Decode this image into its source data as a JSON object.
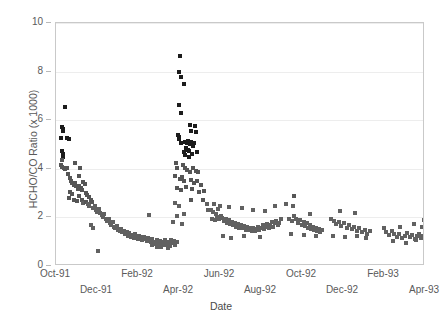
{
  "chart_data": {
    "type": "scatter",
    "title": "",
    "xlabel": "Date",
    "ylabel": "HCHO/CO Ratio (x 1000)",
    "ylim": [
      0,
      10
    ],
    "yticks": [
      0,
      2,
      4,
      6,
      8,
      10
    ],
    "ytick_labels": [
      "0",
      "2",
      "4",
      "6",
      "8",
      "10"
    ],
    "grid": "horizontal",
    "legend": "none",
    "marker": "square",
    "marker_color": "#616161",
    "frame_color": "#c9c9c9",
    "xlim_months": [
      0,
      18
    ],
    "xtick_months": [
      0,
      2,
      4,
      6,
      8,
      10,
      12,
      14,
      16,
      18
    ],
    "xtick_labels": [
      "Oct-91",
      "Dec-91",
      "Feb-92",
      "Apr-92",
      "Jun-92",
      "Aug-92",
      "Oct-92",
      "Dec-92",
      "Feb-93",
      "Apr-93"
    ],
    "xtick_rows": [
      0,
      1,
      0,
      1,
      0,
      1,
      0,
      1,
      0,
      1
    ],
    "x_unit": "months since Oct-91",
    "series": [
      {
        "name": "HCHO/CO ratio",
        "points": [
          [
            0.42,
            6.55
          ],
          [
            0.3,
            5.7
          ],
          [
            0.33,
            5.62
          ],
          [
            0.36,
            5.55
          ],
          [
            0.22,
            5.28
          ],
          [
            0.55,
            5.25
          ],
          [
            0.62,
            5.22
          ],
          [
            0.3,
            4.72
          ],
          [
            0.33,
            4.6
          ],
          [
            0.36,
            4.5
          ],
          [
            0.28,
            4.38
          ],
          [
            0.24,
            4.15
          ],
          [
            0.31,
            4.08
          ],
          [
            0.38,
            4.02
          ],
          [
            0.45,
            3.98
          ],
          [
            0.52,
            4.05
          ],
          [
            0.95,
            4.25
          ],
          [
            1.18,
            4.05
          ],
          [
            1.1,
            3.72
          ],
          [
            0.58,
            3.8
          ],
          [
            0.66,
            3.62
          ],
          [
            0.72,
            3.5
          ],
          [
            0.8,
            3.4
          ],
          [
            0.86,
            3.35
          ],
          [
            0.92,
            3.42
          ],
          [
            0.99,
            3.28
          ],
          [
            1.05,
            3.18
          ],
          [
            1.12,
            3.3
          ],
          [
            1.2,
            3.2
          ],
          [
            1.27,
            3.12
          ],
          [
            1.34,
            3.45
          ],
          [
            1.4,
            3.38
          ],
          [
            1.47,
            3.0
          ],
          [
            1.52,
            2.92
          ],
          [
            1.6,
            2.85
          ],
          [
            0.7,
            3.05
          ],
          [
            0.78,
            2.95
          ],
          [
            0.62,
            2.78
          ],
          [
            0.88,
            2.7
          ],
          [
            1.0,
            2.68
          ],
          [
            1.1,
            2.88
          ],
          [
            1.25,
            2.72
          ],
          [
            1.32,
            2.58
          ],
          [
            1.44,
            2.62
          ],
          [
            1.55,
            2.55
          ],
          [
            1.63,
            2.48
          ],
          [
            1.7,
            2.7
          ],
          [
            1.76,
            2.62
          ],
          [
            1.82,
            2.38
          ],
          [
            1.88,
            2.45
          ],
          [
            1.95,
            2.3
          ],
          [
            2.02,
            2.22
          ],
          [
            2.1,
            2.35
          ],
          [
            2.16,
            2.18
          ],
          [
            2.22,
            2.08
          ],
          [
            2.3,
            2.0
          ],
          [
            2.36,
            2.12
          ],
          [
            2.43,
            1.92
          ],
          [
            2.5,
            1.85
          ],
          [
            2.57,
            1.95
          ],
          [
            2.63,
            1.78
          ],
          [
            2.7,
            1.7
          ],
          [
            2.76,
            1.82
          ],
          [
            2.83,
            1.62
          ],
          [
            2.9,
            1.55
          ],
          [
            2.97,
            1.66
          ],
          [
            3.04,
            1.48
          ],
          [
            3.1,
            1.42
          ],
          [
            3.17,
            1.52
          ],
          [
            3.24,
            1.38
          ],
          [
            3.3,
            1.45
          ],
          [
            3.38,
            1.3
          ],
          [
            3.45,
            1.4
          ],
          [
            3.52,
            1.25
          ],
          [
            3.58,
            1.35
          ],
          [
            3.65,
            1.2
          ],
          [
            3.72,
            1.28
          ],
          [
            3.8,
            1.15
          ],
          [
            3.86,
            1.32
          ],
          [
            3.93,
            1.22
          ],
          [
            4.0,
            1.12
          ],
          [
            4.07,
            1.25
          ],
          [
            4.14,
            1.18
          ],
          [
            4.2,
            1.08
          ],
          [
            4.28,
            1.2
          ],
          [
            4.35,
            1.1
          ],
          [
            4.42,
            1.02
          ],
          [
            4.5,
            1.15
          ],
          [
            4.56,
            1.05
          ],
          [
            4.63,
            0.98
          ],
          [
            4.7,
            1.1
          ],
          [
            4.78,
            1.0
          ],
          [
            4.85,
            0.92
          ],
          [
            4.92,
            1.05
          ],
          [
            5.0,
            0.95
          ],
          [
            5.08,
            1.02
          ],
          [
            5.15,
            0.88
          ],
          [
            5.22,
            0.98
          ],
          [
            5.3,
            1.08
          ],
          [
            5.38,
            0.95
          ],
          [
            5.45,
            1.0
          ],
          [
            5.52,
            0.9
          ],
          [
            5.6,
            1.05
          ],
          [
            5.68,
            0.96
          ],
          [
            5.75,
            1.02
          ],
          [
            5.82,
            0.88
          ],
          [
            5.9,
            1.0
          ],
          [
            1.72,
            1.68
          ],
          [
            1.8,
            1.55
          ],
          [
            2.05,
            0.6
          ],
          [
            4.55,
            2.1
          ],
          [
            6.05,
            8.65
          ],
          [
            5.98,
            7.98
          ],
          [
            6.12,
            7.78
          ],
          [
            6.25,
            7.48
          ],
          [
            6.0,
            6.62
          ],
          [
            6.1,
            6.28
          ],
          [
            6.55,
            5.82
          ],
          [
            6.78,
            5.78
          ],
          [
            6.58,
            5.55
          ],
          [
            6.82,
            5.52
          ],
          [
            5.95,
            5.38
          ],
          [
            5.98,
            5.3
          ],
          [
            6.02,
            5.22
          ],
          [
            6.08,
            5.05
          ],
          [
            6.3,
            5.12
          ],
          [
            6.38,
            5.08
          ],
          [
            6.45,
            5.15
          ],
          [
            6.52,
            5.02
          ],
          [
            6.6,
            5.1
          ],
          [
            6.68,
            4.95
          ],
          [
            6.72,
            5.05
          ],
          [
            6.35,
            4.85
          ],
          [
            6.42,
            4.78
          ],
          [
            6.5,
            4.72
          ],
          [
            6.22,
            4.68
          ],
          [
            6.3,
            4.55
          ],
          [
            6.48,
            4.5
          ],
          [
            6.65,
            4.62
          ],
          [
            6.88,
            4.68
          ],
          [
            5.85,
            4.22
          ],
          [
            5.9,
            4.05
          ],
          [
            6.18,
            4.15
          ],
          [
            6.28,
            4.02
          ],
          [
            6.4,
            3.95
          ],
          [
            6.55,
            3.88
          ],
          [
            6.7,
            4.05
          ],
          [
            6.85,
            3.92
          ],
          [
            6.95,
            3.85
          ],
          [
            5.8,
            3.7
          ],
          [
            6.05,
            3.58
          ],
          [
            6.15,
            3.65
          ],
          [
            6.25,
            3.48
          ],
          [
            6.58,
            3.55
          ],
          [
            6.72,
            3.42
          ],
          [
            6.9,
            3.5
          ],
          [
            7.05,
            3.35
          ],
          [
            5.88,
            3.2
          ],
          [
            6.1,
            3.12
          ],
          [
            6.32,
            3.25
          ],
          [
            6.62,
            3.18
          ],
          [
            6.98,
            3.05
          ],
          [
            7.2,
            3.1
          ],
          [
            5.82,
            2.58
          ],
          [
            6.02,
            2.45
          ],
          [
            6.6,
            2.72
          ],
          [
            7.15,
            2.7
          ],
          [
            7.35,
            2.55
          ],
          [
            5.92,
            2.05
          ],
          [
            6.25,
            2.12
          ],
          [
            7.4,
            2.3
          ],
          [
            5.7,
            1.8
          ],
          [
            6.15,
            1.72
          ],
          [
            4.68,
            0.85
          ],
          [
            4.95,
            0.8
          ],
          [
            5.12,
            0.78
          ],
          [
            5.3,
            0.86
          ],
          [
            5.45,
            0.75
          ],
          [
            5.55,
            0.82
          ],
          [
            7.55,
            2.3
          ],
          [
            7.68,
            2.22
          ],
          [
            7.8,
            2.15
          ],
          [
            7.9,
            2.35
          ],
          [
            7.62,
            1.95
          ],
          [
            7.75,
            1.88
          ],
          [
            7.85,
            2.0
          ],
          [
            7.95,
            1.92
          ],
          [
            8.05,
            2.05
          ],
          [
            8.12,
            1.98
          ],
          [
            8.2,
            1.85
          ],
          [
            8.28,
            1.95
          ],
          [
            8.35,
            1.78
          ],
          [
            8.42,
            1.88
          ],
          [
            8.5,
            1.72
          ],
          [
            8.58,
            1.82
          ],
          [
            8.65,
            1.68
          ],
          [
            8.72,
            1.78
          ],
          [
            8.8,
            1.62
          ],
          [
            8.88,
            1.72
          ],
          [
            8.95,
            1.58
          ],
          [
            9.02,
            1.68
          ],
          [
            9.1,
            1.55
          ],
          [
            9.18,
            1.65
          ],
          [
            9.25,
            1.5
          ],
          [
            9.32,
            1.62
          ],
          [
            9.4,
            1.48
          ],
          [
            9.48,
            1.58
          ],
          [
            9.55,
            1.45
          ],
          [
            9.62,
            1.55
          ],
          [
            9.7,
            1.42
          ],
          [
            9.78,
            1.52
          ],
          [
            9.85,
            1.62
          ],
          [
            9.92,
            1.48
          ],
          [
            10.0,
            1.55
          ],
          [
            10.08,
            1.68
          ],
          [
            10.15,
            1.52
          ],
          [
            10.22,
            1.62
          ],
          [
            10.3,
            1.72
          ],
          [
            10.38,
            1.58
          ],
          [
            10.45,
            1.68
          ],
          [
            10.52,
            1.8
          ],
          [
            10.6,
            1.62
          ],
          [
            10.68,
            1.75
          ],
          [
            10.75,
            1.85
          ],
          [
            10.82,
            1.7
          ],
          [
            10.9,
            1.78
          ],
          [
            10.98,
            1.92
          ],
          [
            7.72,
            2.55
          ],
          [
            8.02,
            2.48
          ],
          [
            8.45,
            2.42
          ],
          [
            9.05,
            2.38
          ],
          [
            9.6,
            2.32
          ],
          [
            10.2,
            2.28
          ],
          [
            10.7,
            2.45
          ],
          [
            8.15,
            1.22
          ],
          [
            8.55,
            1.15
          ],
          [
            9.15,
            1.25
          ],
          [
            9.95,
            1.18
          ],
          [
            11.2,
            2.55
          ],
          [
            11.55,
            2.48
          ],
          [
            11.35,
            1.95
          ],
          [
            11.5,
            1.85
          ],
          [
            11.62,
            2.05
          ],
          [
            11.72,
            1.92
          ],
          [
            11.82,
            1.78
          ],
          [
            11.9,
            1.88
          ],
          [
            12.0,
            1.7
          ],
          [
            12.08,
            1.82
          ],
          [
            12.15,
            1.65
          ],
          [
            12.22,
            1.75
          ],
          [
            12.3,
            1.58
          ],
          [
            12.38,
            1.68
          ],
          [
            12.45,
            1.52
          ],
          [
            12.52,
            1.62
          ],
          [
            12.6,
            1.48
          ],
          [
            12.68,
            1.58
          ],
          [
            12.75,
            1.42
          ],
          [
            12.82,
            1.52
          ],
          [
            12.9,
            1.38
          ],
          [
            12.98,
            1.48
          ],
          [
            11.45,
            1.32
          ],
          [
            12.1,
            1.28
          ],
          [
            12.7,
            1.22
          ],
          [
            11.6,
            2.88
          ],
          [
            12.4,
            2.15
          ],
          [
            13.4,
            1.95
          ],
          [
            13.55,
            1.85
          ],
          [
            13.68,
            1.72
          ],
          [
            13.8,
            1.8
          ],
          [
            13.92,
            1.65
          ],
          [
            14.05,
            1.75
          ],
          [
            14.18,
            1.58
          ],
          [
            14.3,
            1.68
          ],
          [
            14.42,
            1.52
          ],
          [
            14.55,
            1.62
          ],
          [
            14.68,
            1.45
          ],
          [
            14.8,
            1.55
          ],
          [
            14.92,
            1.38
          ],
          [
            15.05,
            1.48
          ],
          [
            15.18,
            1.32
          ],
          [
            15.3,
            1.42
          ],
          [
            13.5,
            1.25
          ],
          [
            14.1,
            1.18
          ],
          [
            14.7,
            1.22
          ],
          [
            15.1,
            1.15
          ],
          [
            13.85,
            2.28
          ],
          [
            14.6,
            2.18
          ],
          [
            16.1,
            1.38
          ],
          [
            16.25,
            1.28
          ],
          [
            16.38,
            1.42
          ],
          [
            16.5,
            1.32
          ],
          [
            16.62,
            1.2
          ],
          [
            16.75,
            1.3
          ],
          [
            16.88,
            1.15
          ],
          [
            17.0,
            1.25
          ],
          [
            17.12,
            1.35
          ],
          [
            17.25,
            1.18
          ],
          [
            17.38,
            1.28
          ],
          [
            17.5,
            1.1
          ],
          [
            17.62,
            1.22
          ],
          [
            17.72,
            1.32
          ],
          [
            17.82,
            1.15
          ],
          [
            17.9,
            1.25
          ],
          [
            16.45,
            1.02
          ],
          [
            17.05,
            0.95
          ],
          [
            17.55,
            1.05
          ],
          [
            17.45,
            1.72
          ],
          [
            17.85,
            1.62
          ],
          [
            17.95,
            1.88
          ],
          [
            16.0,
            1.55
          ],
          [
            16.8,
            1.6
          ]
        ]
      }
    ]
  }
}
